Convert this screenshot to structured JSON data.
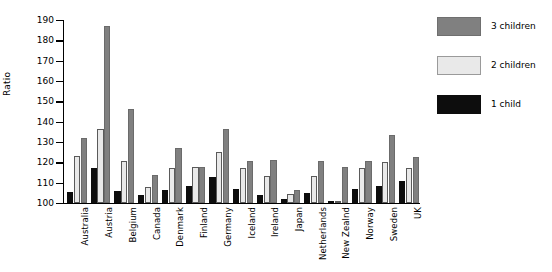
{
  "chart_data": {
    "type": "bar",
    "title": "",
    "xlabel": "",
    "ylabel": "Ratio",
    "ylim": [
      100,
      190
    ],
    "yticks": [
      100,
      110,
      120,
      130,
      140,
      150,
      160,
      170,
      180,
      190
    ],
    "grid": false,
    "legend_position": "right",
    "categories": [
      "Australia",
      "Austria",
      "Belgium",
      "Canada",
      "Denmark",
      "Finland",
      "Germany",
      "Iceland",
      "Ireland",
      "Japan",
      "Netherlands",
      "New Zealnd",
      "Norway",
      "Sweden",
      "UK"
    ],
    "series": [
      {
        "name": "1 child",
        "color": "#0d0d0d",
        "values": [
          105.5,
          117,
          106,
          104,
          106.5,
          108.5,
          113,
          107,
          104,
          102,
          105,
          100,
          107,
          108.5,
          111
        ]
      },
      {
        "name": "2 children",
        "color": "#e9e9e9",
        "values": [
          123,
          136.5,
          120.5,
          108,
          117,
          117.5,
          125,
          117,
          113.5,
          104.5,
          113.5,
          100,
          117,
          120,
          117
        ]
      },
      {
        "name": "3 children",
        "color": "#808080",
        "values": [
          132,
          187,
          146,
          114,
          127,
          117.5,
          136.5,
          120.5,
          121,
          106.5,
          120.5,
          117.5,
          120.5,
          133.5,
          122.5
        ]
      }
    ]
  },
  "legend": {
    "entries": [
      {
        "label": "3 children",
        "color": "#808080"
      },
      {
        "label": "2 children",
        "color": "#e9e9e9"
      },
      {
        "label": "1 child",
        "color": "#0d0d0d"
      }
    ]
  },
  "caption": ""
}
